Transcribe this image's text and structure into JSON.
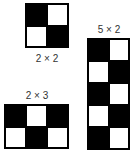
{
  "figures": [
    {
      "label": "2 × 2",
      "rows": 2,
      "cols": 2,
      "cells": [
        "b",
        "w",
        "w",
        "b"
      ]
    },
    {
      "label": "2 × 3",
      "rows": 2,
      "cols": 3,
      "cells": [
        "b",
        "w",
        "b",
        "w",
        "b",
        "w"
      ]
    },
    {
      "label": "5 × 2",
      "rows": 5,
      "cols": 2,
      "cells": [
        "b",
        "w",
        "w",
        "b",
        "b",
        "w",
        "w",
        "b",
        "b",
        "w"
      ]
    }
  ],
  "colors": {
    "dark": "#000000",
    "light": "#ffffff"
  }
}
